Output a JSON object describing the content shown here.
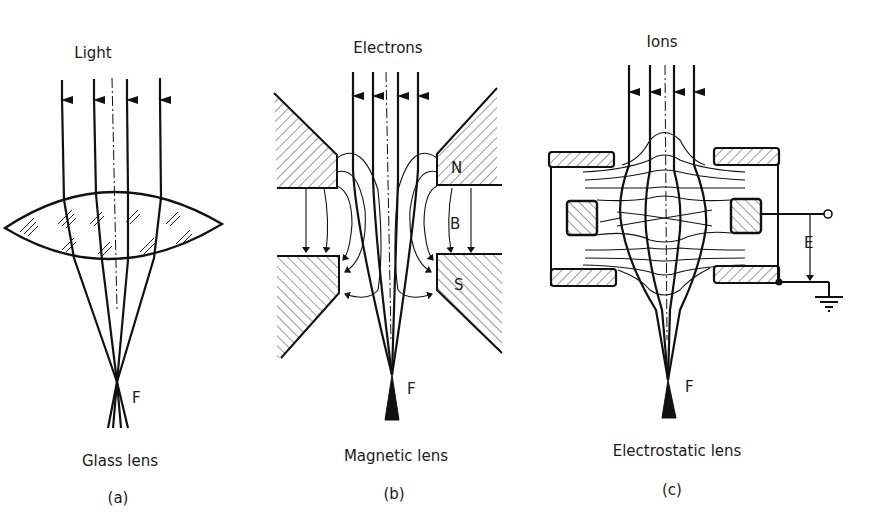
{
  "figure": {
    "panels": [
      {
        "id": "a",
        "top_label": "Light",
        "focus_label": "F",
        "caption": "Glass lens",
        "sublabel": "(a)"
      },
      {
        "id": "b",
        "top_label": "Electrons",
        "focus_label": "F",
        "pole_north": "N",
        "pole_south": "S",
        "field_label": "B",
        "caption": "Magnetic lens",
        "sublabel": "(b)"
      },
      {
        "id": "c",
        "top_label": "Ions",
        "focus_label": "F",
        "field_label": "E",
        "caption": "Electrostatic lens",
        "sublabel": "(c)"
      }
    ]
  },
  "colors": {
    "ink": "#111111",
    "background": "#ffffff"
  }
}
